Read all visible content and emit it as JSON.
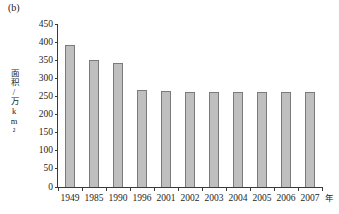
{
  "figure": {
    "panel_label": "(b)",
    "background": "#ffffff"
  },
  "axes": {
    "y_title": "面积/万km²",
    "x_unit": "年",
    "bar_fill": "#bfbfbf",
    "bar_stroke": "#7b7b7b",
    "axis_color": "#3a3a3a"
  },
  "chart_data": {
    "type": "bar",
    "title": "(b)",
    "xlabel": "年",
    "ylabel": "面积/万km²",
    "ylim": [
      0,
      450
    ],
    "yticks": [
      0,
      50,
      100,
      150,
      200,
      250,
      300,
      350,
      400,
      450
    ],
    "grid": false,
    "legend": null,
    "categories": [
      "1949",
      "1985",
      "1990",
      "1996",
      "2001",
      "2002",
      "2003",
      "2004",
      "2005",
      "2006",
      "2007"
    ],
    "values": [
      393,
      352,
      341,
      267,
      265,
      262,
      262,
      262,
      262,
      262,
      262
    ],
    "series": [
      {
        "name": "面积",
        "values": [
          393,
          352,
          341,
          267,
          265,
          262,
          262,
          262,
          262,
          262,
          262
        ]
      }
    ]
  }
}
